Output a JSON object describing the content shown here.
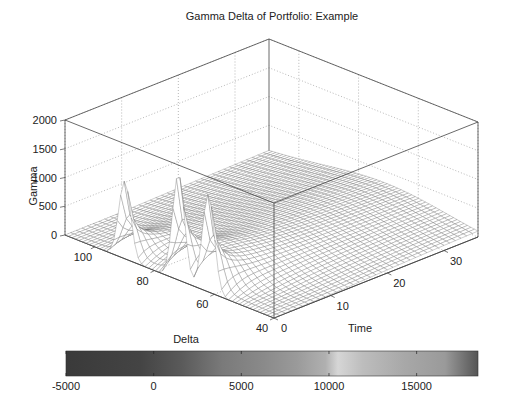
{
  "chart_data": {
    "type": "surface",
    "title": "Gamma Delta of Portfolio: Example",
    "xlabel": "Delta",
    "ylabel": "Time",
    "zlabel": "Gamma",
    "x_ticks": [
      40,
      60,
      80,
      100
    ],
    "x_range": [
      40,
      110
    ],
    "y_ticks": [
      0,
      10,
      20,
      30
    ],
    "y_range": [
      0,
      36
    ],
    "z_ticks": [
      0,
      500,
      1000,
      1500,
      2000
    ],
    "z_range": [
      0,
      2000
    ],
    "grid": true,
    "peaks": [
      {
        "delta": 90,
        "time": 0,
        "gamma": 1350
      },
      {
        "delta": 72,
        "time": 0,
        "gamma": 1850
      },
      {
        "delta": 62,
        "time": 0,
        "gamma": 1700
      }
    ],
    "colorbar": {
      "orientation": "horizontal",
      "range": [
        -5000,
        18500
      ],
      "ticks": [
        -5000,
        0,
        5000,
        10000,
        15000
      ],
      "tick_labels": [
        "-5000",
        "0",
        "5000",
        "10000",
        "15000"
      ],
      "colors": [
        "#3a3a3a",
        "#444444",
        "#5a5a5a",
        "#7a7a7a",
        "#8a8a8a",
        "#9a9a9a",
        "#b0b0b0",
        "#d6d6d6",
        "#bdbdbd",
        "#a8a8a8",
        "#9a9a9a",
        "#555555"
      ],
      "stops": [
        0,
        0.18,
        0.28,
        0.38,
        0.48,
        0.56,
        0.63,
        0.66,
        0.72,
        0.82,
        0.92,
        1.0
      ]
    }
  }
}
